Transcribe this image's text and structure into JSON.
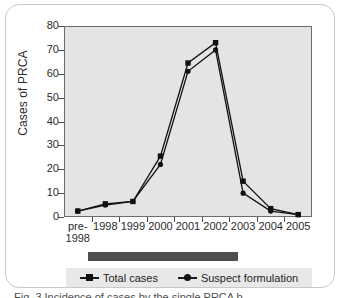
{
  "figure": {
    "caption": "Fig. 3 Incidence of cases by the single PRCA b..."
  },
  "legend": {
    "items": [
      {
        "label": "Total cases",
        "marker": "square-marker-icon",
        "color": "#111111"
      },
      {
        "label": "Suspect formulation",
        "marker": "circle-marker-icon",
        "color": "#111111"
      }
    ]
  },
  "chart_data": {
    "type": "line",
    "title": "",
    "xlabel": "",
    "ylabel": "Cases of PRCA",
    "categories": [
      "pre-1998",
      "1998",
      "1999",
      "2000",
      "2001",
      "2002",
      "2003",
      "2004",
      "2005"
    ],
    "x_tick_lines": [
      [
        "pre-",
        "1998"
      ],
      [
        "1998"
      ],
      [
        "1999"
      ],
      [
        "2000"
      ],
      [
        "2001"
      ],
      [
        "2002"
      ],
      [
        "2003"
      ],
      [
        "2004"
      ],
      [
        "2005"
      ]
    ],
    "ylim": [
      0,
      80
    ],
    "y_ticks": [
      0,
      10,
      20,
      30,
      40,
      50,
      60,
      70,
      80
    ],
    "grid": false,
    "legend_position": "bottom",
    "plot_background": "#e4e4e4",
    "series": [
      {
        "name": "Total cases",
        "marker": "square",
        "color": "#111111",
        "values": [
          2.5,
          5.5,
          6.5,
          25.5,
          64.5,
          73,
          15,
          3.5,
          1
        ]
      },
      {
        "name": "Suspect formulation",
        "marker": "circle",
        "color": "#111111",
        "values": [
          2.5,
          5,
          6.5,
          22,
          61,
          70,
          10,
          2.5,
          1
        ]
      }
    ]
  }
}
